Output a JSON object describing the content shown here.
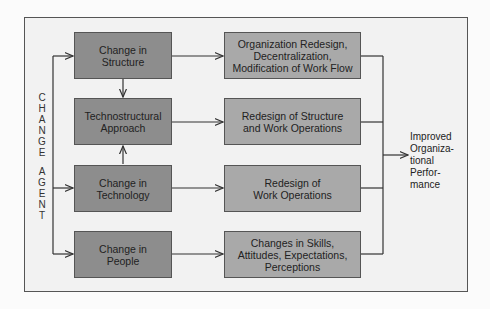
{
  "diagram": {
    "change_agent_label": [
      "C",
      "H",
      "A",
      "N",
      "G",
      "E",
      " ",
      "A",
      "G",
      "E",
      "N",
      "T"
    ],
    "left_boxes": [
      {
        "line1": "Change in",
        "line2": "Structure"
      },
      {
        "line1": "Technostructural",
        "line2": "Approach"
      },
      {
        "line1": "Change in",
        "line2": "Technology"
      },
      {
        "line1": "Change in",
        "line2": "People"
      }
    ],
    "right_boxes": [
      {
        "lines": [
          "Organization Redesign,",
          "Decentralization,",
          "Modification of Work Flow"
        ]
      },
      {
        "lines": [
          "Redesign of Structure",
          "and Work Operations"
        ]
      },
      {
        "lines": [
          "Redesign of",
          "Work Operations"
        ]
      },
      {
        "lines": [
          "Changes in Skills,",
          "Attitudes, Expectations,",
          "Perceptions"
        ]
      }
    ],
    "outcome": [
      "Improved",
      "Organiza-",
      "tional",
      "Perfor-",
      "mance"
    ],
    "colors": {
      "left_box": "#8d8d8d",
      "right_box": "#a9a9a9",
      "frame_bg": "#f2f2f2",
      "line": "#333333"
    }
  }
}
